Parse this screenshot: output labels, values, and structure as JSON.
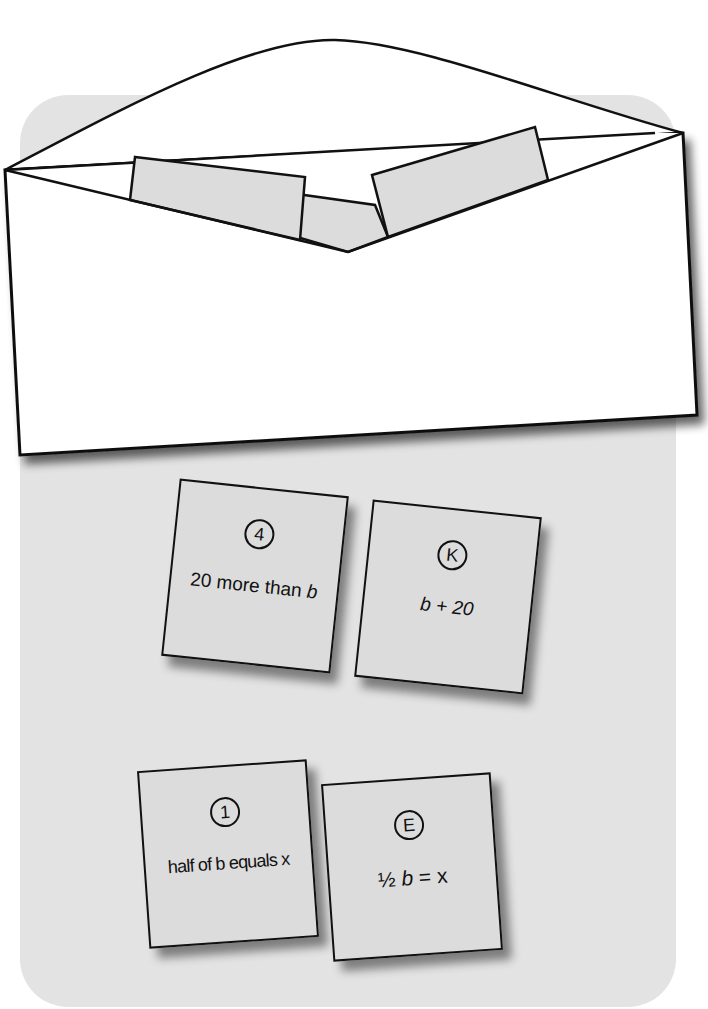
{
  "scene": {
    "background_color": "#e3e3e3",
    "envelope_color": "#ffffff",
    "card_color": "#dcdcdc",
    "stroke_color": "#111111"
  },
  "cards": [
    {
      "badge": "4",
      "text_prefix": "20 more than ",
      "text_var": "b",
      "text_suffix": ""
    },
    {
      "badge": "K",
      "text_prefix": "",
      "text_var": "b",
      "text_suffix": " + 20"
    },
    {
      "badge": "1",
      "text_prefix": "half of b equals x",
      "text_var": "",
      "text_suffix": ""
    },
    {
      "badge": "E",
      "text_prefix": "½ ",
      "text_var": "b",
      "text_suffix": " = x"
    }
  ]
}
